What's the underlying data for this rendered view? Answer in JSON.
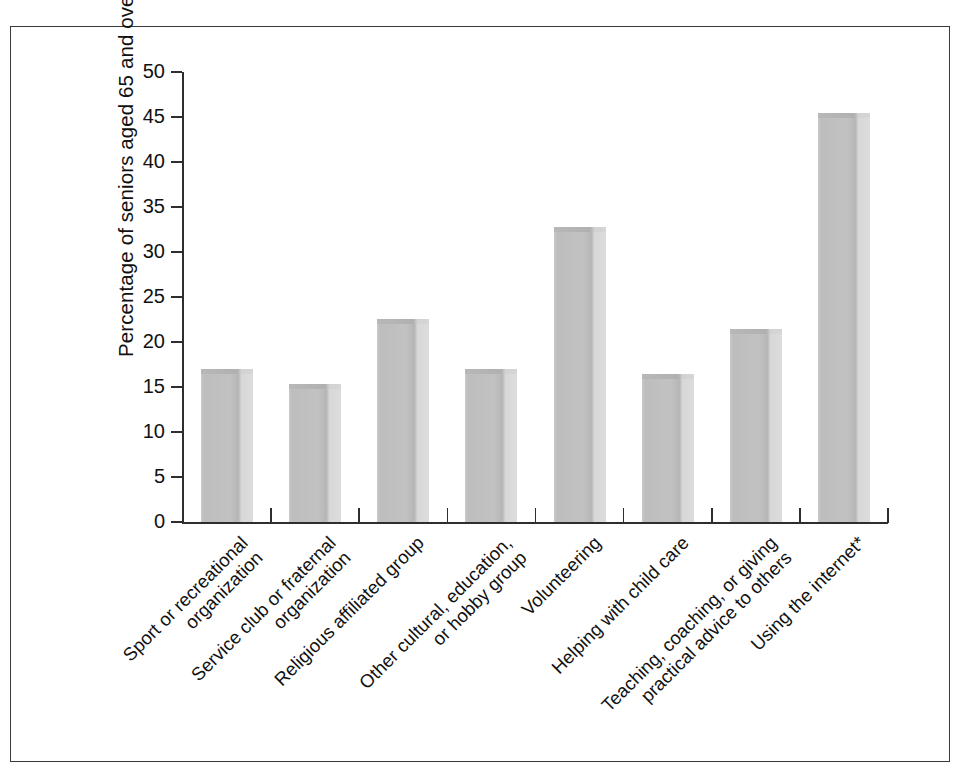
{
  "figure": {
    "frame_border_color": "#3a3a3a",
    "background_color": "#ffffff",
    "bar_fill_color": "#c2c2c2",
    "axis_color": "#2e2e2e"
  },
  "axes": {
    "y_axis_title": "Percentage of seniors aged 65 and over",
    "y_tick_labels": [
      "50",
      "45",
      "40",
      "35",
      "30",
      "25",
      "20",
      "15",
      "10",
      "5",
      "0"
    ]
  },
  "chart_data": {
    "type": "bar",
    "title": "",
    "xlabel": "",
    "ylabel": "Percentage of seniors aged 65 and over",
    "ylim": [
      0,
      50
    ],
    "ytick_step": 5,
    "grid": false,
    "legend": false,
    "orientation": "vertical",
    "categories": [
      "Sport or recreational organization",
      "Service club or fraternal organization",
      "Religious affiliated group",
      "Other cultural, education, or hobby group",
      "Volunteering",
      "Helping with child care",
      "Teaching, coaching, or giving practical advice to others",
      "Using the internet*"
    ],
    "category_lines": [
      [
        "Sport or recreational",
        "organization"
      ],
      [
        "Service club or fraternal",
        "organization"
      ],
      [
        "Religious affiliated group"
      ],
      [
        "Other cultural, education,",
        "or hobby group"
      ],
      [
        "Volunteering"
      ],
      [
        "Helping with child care"
      ],
      [
        "Teaching, coaching, or giving",
        "practical advice to others"
      ],
      [
        "Using the internet*"
      ]
    ],
    "values": [
      17.0,
      15.3,
      22.6,
      17.0,
      32.8,
      16.4,
      21.4,
      45.4
    ],
    "footnote_marker": "*"
  }
}
